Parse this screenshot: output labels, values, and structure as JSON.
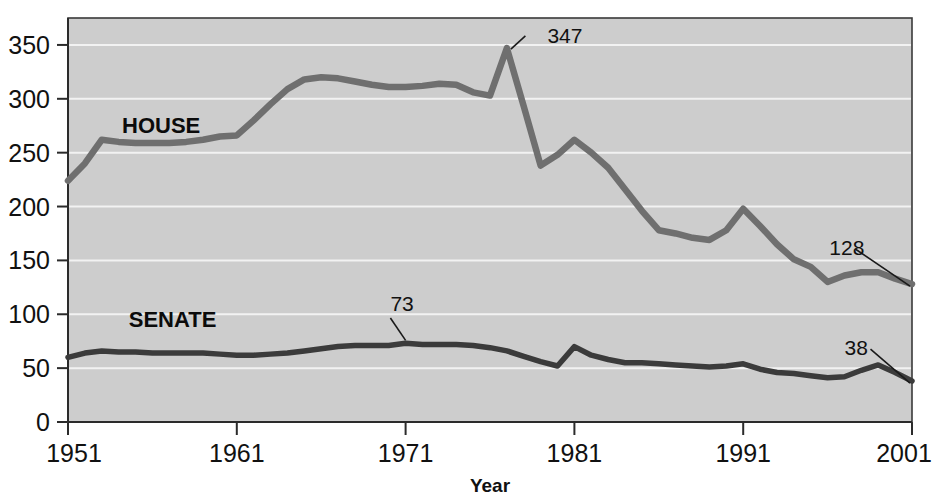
{
  "chart_data": {
    "type": "line",
    "title": "",
    "xlabel": "Year",
    "ylabel": "",
    "xlim": [
      1951,
      2001
    ],
    "ylim": [
      0,
      375
    ],
    "grid": true,
    "legend_position": "inline-labels",
    "x_ticks": [
      "1951",
      "1961",
      "1971",
      "1981",
      "1991",
      "2001"
    ],
    "x_tick_values": [
      1951,
      1961,
      1971,
      1981,
      1991,
      2001
    ],
    "y_ticks": [
      "0",
      "50",
      "100",
      "150",
      "200",
      "250",
      "300",
      "350"
    ],
    "y_tick_values": [
      0,
      50,
      100,
      150,
      200,
      250,
      300,
      350
    ],
    "x": [
      1951,
      1952,
      1953,
      1954,
      1955,
      1956,
      1957,
      1958,
      1959,
      1960,
      1961,
      1962,
      1963,
      1964,
      1965,
      1966,
      1967,
      1968,
      1969,
      1970,
      1971,
      1972,
      1973,
      1974,
      1975,
      1976,
      1977,
      1978,
      1979,
      1980,
      1981,
      1982,
      1983,
      1984,
      1985,
      1986,
      1987,
      1988,
      1989,
      1990,
      1991,
      1992,
      1993,
      1994,
      1995,
      1996,
      1997,
      1998,
      1999,
      2000,
      2001
    ],
    "series": [
      {
        "name": "HOUSE",
        "color": "#6f6f6f",
        "label_x": 1954.2,
        "label_y": 268,
        "values": [
          224,
          240,
          262,
          260,
          259,
          259,
          259,
          260,
          262,
          265,
          266,
          280,
          295,
          309,
          318,
          320,
          319,
          316,
          313,
          311,
          311,
          312,
          314,
          313,
          306,
          303,
          347,
          293,
          238,
          248,
          262,
          250,
          236,
          216,
          196,
          178,
          175,
          171,
          169,
          178,
          198,
          182,
          165,
          151,
          144,
          130,
          136,
          139,
          139,
          133,
          128
        ]
      },
      {
        "name": "SENATE",
        "color": "#3b3b3b",
        "label_x": 1954.6,
        "label_y": 88,
        "values": [
          60,
          64,
          66,
          65,
          65,
          64,
          64,
          64,
          64,
          63,
          62,
          62,
          63,
          64,
          66,
          68,
          70,
          71,
          71,
          71,
          73,
          72,
          72,
          72,
          71,
          69,
          66,
          61,
          56,
          52,
          70,
          62,
          58,
          55,
          55,
          54,
          53,
          52,
          51,
          52,
          54,
          49,
          46,
          45,
          43,
          41,
          42,
          48,
          53,
          46,
          38
        ]
      }
    ],
    "annotations": [
      {
        "text": "347",
        "point_x": 1977,
        "point_y": 347,
        "label_x": 1979.4,
        "label_y": 352,
        "leader": "diagonal-right"
      },
      {
        "text": "73",
        "point_x": 1971,
        "point_y": 73,
        "label_x": 1970.1,
        "label_y": 103,
        "leader": "vertical-up"
      },
      {
        "text": "128",
        "point_x": 2001,
        "point_y": 128,
        "label_x": 1996.1,
        "label_y": 155,
        "leader": "diagonal-down-right"
      },
      {
        "text": "38",
        "point_x": 2001,
        "point_y": 38,
        "label_x": 1997.0,
        "label_y": 62,
        "leader": "diagonal-down-right"
      }
    ],
    "colors": {
      "plot_background": "#cdcdcd",
      "gridline": "#f2f2f2",
      "axis": "#2b2b2b",
      "house_line": "#6f6f6f",
      "senate_line": "#3b3b3b",
      "text": "#111111",
      "page_background": "#ffffff"
    }
  }
}
